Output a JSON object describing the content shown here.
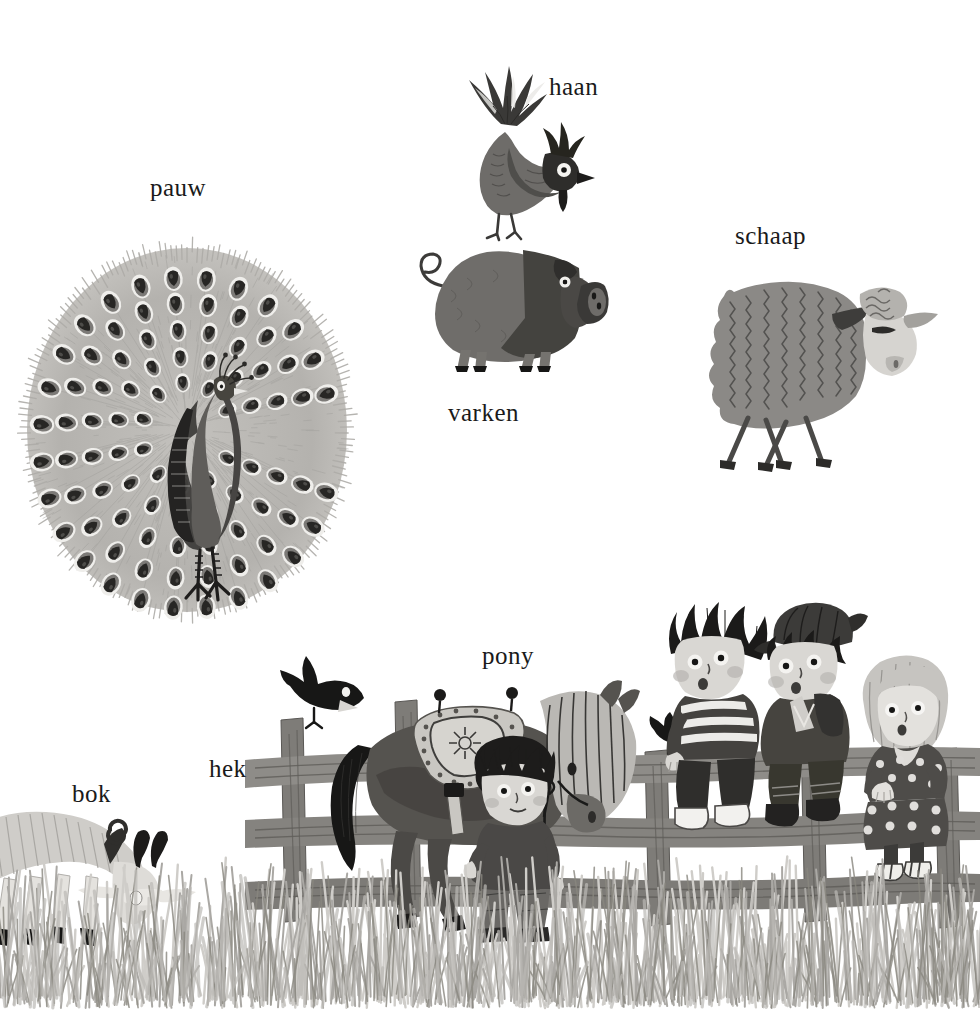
{
  "page": {
    "background_color": "#ffffff",
    "width": 980,
    "height": 1012,
    "style": "grayscale children's book illustration",
    "language": "nl"
  },
  "labels": [
    {
      "id": "pauw",
      "text": "pauw",
      "x": 150,
      "y": 175,
      "font_size": 25,
      "refers_to": "peacock"
    },
    {
      "id": "haan",
      "text": "haan",
      "x": 549,
      "y": 74,
      "font_size": 25,
      "refers_to": "rooster"
    },
    {
      "id": "schaap",
      "text": "schaap",
      "x": 735,
      "y": 223,
      "font_size": 25,
      "refers_to": "sheep"
    },
    {
      "id": "varken",
      "text": "varken",
      "x": 448,
      "y": 400,
      "font_size": 25,
      "refers_to": "pig"
    },
    {
      "id": "pony",
      "text": "pony",
      "x": 482,
      "y": 643,
      "font_size": 25,
      "refers_to": "pony"
    },
    {
      "id": "hek",
      "text": "hek",
      "x": 209,
      "y": 756,
      "font_size": 25,
      "refers_to": "fence"
    },
    {
      "id": "bok",
      "text": "bok",
      "x": 72,
      "y": 781,
      "font_size": 25,
      "refers_to": "goat"
    }
  ],
  "illustrations": {
    "peacock": {
      "name": "pauw",
      "description": "Peacock with fully fanned tail of eye-spot feathers, dark body, standing on thin legs",
      "bounds": {
        "x": 22,
        "y": 232,
        "w": 330,
        "h": 385
      },
      "fan_rings": [
        {
          "radius": 0.96,
          "count": 26
        },
        {
          "radius": 0.8,
          "count": 22
        },
        {
          "radius": 0.63,
          "count": 18
        },
        {
          "radius": 0.46,
          "count": 14
        },
        {
          "radius": 0.3,
          "count": 10
        }
      ],
      "colors": {
        "fan": "#b0aeaa",
        "eye_outer": "#efeeeb",
        "eye_inner": "#2b2a28",
        "body": "#585654",
        "body_dark": "#2e2d2b",
        "legs": "#1f1e1d"
      }
    },
    "rooster": {
      "name": "haan",
      "description": "Rooster with spiky plume crest, dark comb and wattle, white-ringed eye, standing on the pig",
      "bounds": {
        "x": 435,
        "y": 58,
        "w": 160,
        "h": 175
      },
      "colors": {
        "body": "#6e6c69",
        "plume": "#3a3937",
        "comb": "#2a2927",
        "eye_ring": "#ffffff",
        "eye": "#1b1a19"
      }
    },
    "pig": {
      "name": "varken",
      "description": "Plump pig in profile, curly tail, large snout with two nostrils, split light/dark body shading",
      "bounds": {
        "x": 405,
        "y": 222,
        "w": 205,
        "h": 148
      },
      "colors": {
        "light": "#7b7976",
        "dark": "#4a4947",
        "snout": "#3f3e3c",
        "hooves": "#1a1a19"
      }
    },
    "sheep": {
      "name": "schaap",
      "description": "Sheep with zig-zag textured fleece, curly wool topknot, pale face, four thin crossing legs",
      "bounds": {
        "x": 690,
        "y": 258,
        "w": 245,
        "h": 215
      },
      "colors": {
        "fleece": "#8b8986",
        "fleece_lines": "#4f4e4c",
        "face": "#d6d4d0",
        "legs": "#4a4947"
      }
    },
    "goat": {
      "name": "bok",
      "description": "Pale goat grazing at the left edge, two curved black horns, black hooves, head lowered into grass",
      "bounds": {
        "x": -10,
        "y": 800,
        "w": 215,
        "h": 160
      },
      "colors": {
        "body": "#cfcdc9",
        "shading": "#9d9b97",
        "horns": "#1c1b1a",
        "hooves": "#141413"
      }
    },
    "pony": {
      "name": "pony",
      "description": "Dark pony with long pale shaggy mane and forelock, decorated saddle with studs, black plume tail, bridle held by a boy",
      "bounds": {
        "x": 305,
        "y": 668,
        "w": 330,
        "h": 268
      },
      "colors": {
        "body": "#55534f",
        "mane": "#bab8b4",
        "saddle": "#c9c7c2",
        "tail": "#171716",
        "bridle": "#1a1a19"
      }
    },
    "fence": {
      "name": "hek",
      "description": "Rustic wooden rail fence with three horizontal rails and several vertical posts, running across the lower scene",
      "bounds": {
        "x": 250,
        "y": 700,
        "w": 700,
        "h": 240
      },
      "rails": 3,
      "colors": {
        "wood": "#8e8c88",
        "wood_dark": "#5c5a57",
        "grain": "#6d6b67"
      }
    },
    "bird_on_post": {
      "name": "vogel",
      "description": "Small black bird perched on a fence post, wings folded, pale beak",
      "bounds": {
        "x": 282,
        "y": 660,
        "w": 78,
        "h": 70
      },
      "colors": {
        "body": "#171716",
        "beak": "#d8d6d2"
      }
    },
    "bird_small_right": {
      "name": "vogel-klein",
      "description": "Second small black bird perched on the fence rail near the boy in the striped shirt",
      "bounds": {
        "x": 650,
        "y": 715,
        "w": 45,
        "h": 35
      },
      "colors": {
        "body": "#171716"
      }
    },
    "boy_with_pony": {
      "name": "jongen-met-pony",
      "description": "Boy standing beside the pony, spiky dark hair, dark shirt, grey trousers, holding the rein, black shoes",
      "bounds": {
        "x": 465,
        "y": 738,
        "w": 110,
        "h": 205
      },
      "colors": {
        "hair": "#1d1c1b",
        "face": "#d9d7d3",
        "shirt": "#4a4846",
        "trousers": "#6a6865",
        "shoes": "#2a2928"
      }
    },
    "boy_striped": {
      "name": "jongen-gestreept",
      "description": "Boy sitting on the fence, spiky dark hair, horizontally striped shirt, dark trousers, white sneakers",
      "bounds": {
        "x": 665,
        "y": 600,
        "w": 115,
        "h": 240
      },
      "colors": {
        "hair": "#1b1a19",
        "face": "#d9d7d3",
        "shirt_dark": "#44423f",
        "shirt_stripe": "#ecebe8",
        "trousers": "#2f2e2c",
        "shoes": "#f2f1ee"
      }
    },
    "boy_with_cap": {
      "name": "jongen-met-pet",
      "description": "Boy sitting on the fence wearing a flat cap, dark jacket with light collar, dark trousers, dark shoes",
      "bounds": {
        "x": 755,
        "y": 600,
        "w": 115,
        "h": 235
      },
      "colors": {
        "cap": "#3c3b39",
        "hair": "#1b1a19",
        "face": "#d9d7d3",
        "jacket": "#46443f",
        "shoes": "#232221"
      }
    },
    "girl_polka": {
      "name": "meisje-met-stippen",
      "description": "Girl standing behind the fence, pale blonde bob haircut, dark polka-dot dress, arms resting on the rail, striped shoes",
      "bounds": {
        "x": 855,
        "y": 655,
        "w": 105,
        "h": 220
      },
      "colors": {
        "hair": "#c6c4c0",
        "face": "#e3e1dd",
        "dress": "#4e4c49",
        "dots": "#e0dedb",
        "shoes": "#efeeea"
      }
    },
    "grass": {
      "name": "gras",
      "description": "Band of tall brushy grass strokes spanning the full width at the bottom of the page",
      "bounds": {
        "x": 0,
        "y": 860,
        "w": 980,
        "h": 152
      },
      "colors": {
        "light": "#cdcbc7",
        "mid": "#a7a5a1",
        "dark": "#7c7a77"
      }
    }
  }
}
